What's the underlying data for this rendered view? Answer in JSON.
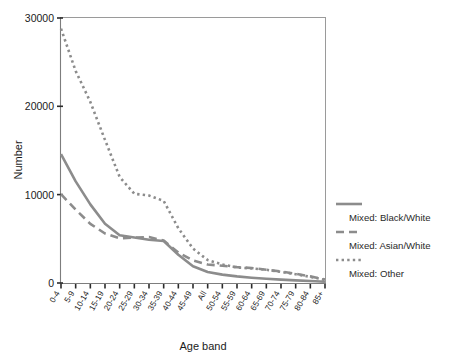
{
  "chart_data": {
    "type": "line",
    "title": "",
    "subtitle": "",
    "xlabel": "Age band",
    "ylabel": "Number",
    "ylim": [
      0,
      30000
    ],
    "yticks": [
      0,
      10000,
      20000,
      30000
    ],
    "ytick_labels": [
      "0",
      "10000",
      "20000",
      "30000"
    ],
    "grid": false,
    "legend_position": "right",
    "categories": [
      "0-4",
      "5-9",
      "10-14",
      "15-19",
      "20-24",
      "25-29",
      "30-34",
      "35-39",
      "40-44",
      "45-49",
      "All",
      "50-54",
      "55-59",
      "60-64",
      "65-69",
      "70-74",
      "75-79",
      "80-84",
      "85+"
    ],
    "series": [
      {
        "name": "Mixed: Black/White",
        "style": "solid",
        "color": "#8c8c8c",
        "values": [
          14600,
          11500,
          8900,
          6700,
          5400,
          5150,
          4900,
          4750,
          3200,
          1900,
          1250,
          950,
          750,
          600,
          480,
          380,
          300,
          220,
          150
        ]
      },
      {
        "name": "Mixed: Asian/White",
        "style": "dashed",
        "color": "#8c8c8c",
        "values": [
          10050,
          8300,
          6700,
          5600,
          5050,
          5150,
          5200,
          4800,
          3450,
          2550,
          2100,
          1950,
          1800,
          1700,
          1500,
          1300,
          1050,
          750,
          400
        ]
      },
      {
        "name": "Mixed: Other",
        "style": "dotted",
        "color": "#8c8c8c",
        "values": [
          28800,
          24000,
          20500,
          16200,
          12000,
          10100,
          9900,
          9300,
          6200,
          3900,
          2600,
          2100,
          1750,
          1650,
          1500,
          1250,
          1000,
          700,
          350
        ]
      }
    ],
    "annotations": []
  },
  "legend": {
    "entries": [
      {
        "label": "Mixed: Black/White",
        "style": "solid"
      },
      {
        "label": "Mixed: Asian/White",
        "style": "dashed"
      },
      {
        "label": "Mixed: Other",
        "style": "dotted"
      }
    ]
  },
  "caption": {
    "text": ""
  },
  "colors": {
    "series": "#8c8c8c",
    "axis": "#7d7d7d",
    "frame": "#9a9a9a",
    "text": "#1b1b1b"
  }
}
